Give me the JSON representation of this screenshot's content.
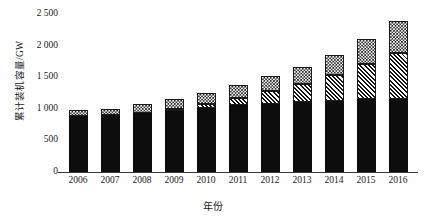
{
  "chart_data": {
    "type": "bar",
    "stacked": true,
    "title": "",
    "xlabel": "年份",
    "ylabel": "累计装机容量/GW",
    "categories": [
      "2006",
      "2007",
      "2008",
      "2009",
      "2010",
      "2011",
      "2012",
      "2013",
      "2014",
      "2015",
      "2016"
    ],
    "ylim": [
      0,
      2500
    ],
    "yticks": [
      0,
      500,
      1000,
      1500,
      2000,
      2500
    ],
    "ytick_labels": [
      "0",
      "500",
      "1 000",
      "1 500",
      "2 000",
      "2 500"
    ],
    "grid": false,
    "legend": "none",
    "series": [
      {
        "name": "segment-black",
        "fill": "solid-black",
        "values": [
          890,
          905,
          935,
          970,
          1010,
          1055,
          1080,
          1100,
          1120,
          1150,
          1162
        ]
      },
      {
        "name": "segment-hatch",
        "fill": "diagonal-hatch",
        "values": [
          0,
          0,
          0,
          20,
          60,
          120,
          200,
          290,
          420,
          560,
          720
        ]
      },
      {
        "name": "segment-check",
        "fill": "checkerboard",
        "values": [
          95,
          100,
          135,
          160,
          180,
          200,
          240,
          270,
          310,
          390,
          510
        ]
      }
    ],
    "totals": [
      985,
      1005,
      1070,
      1150,
      1250,
      1375,
      1520,
      1660,
      1850,
      2100,
      2392
    ],
    "colors": {
      "black": "#0d0d0d",
      "hatch": "#111111",
      "check": "#151515",
      "axis": "#3a3a3a"
    }
  }
}
